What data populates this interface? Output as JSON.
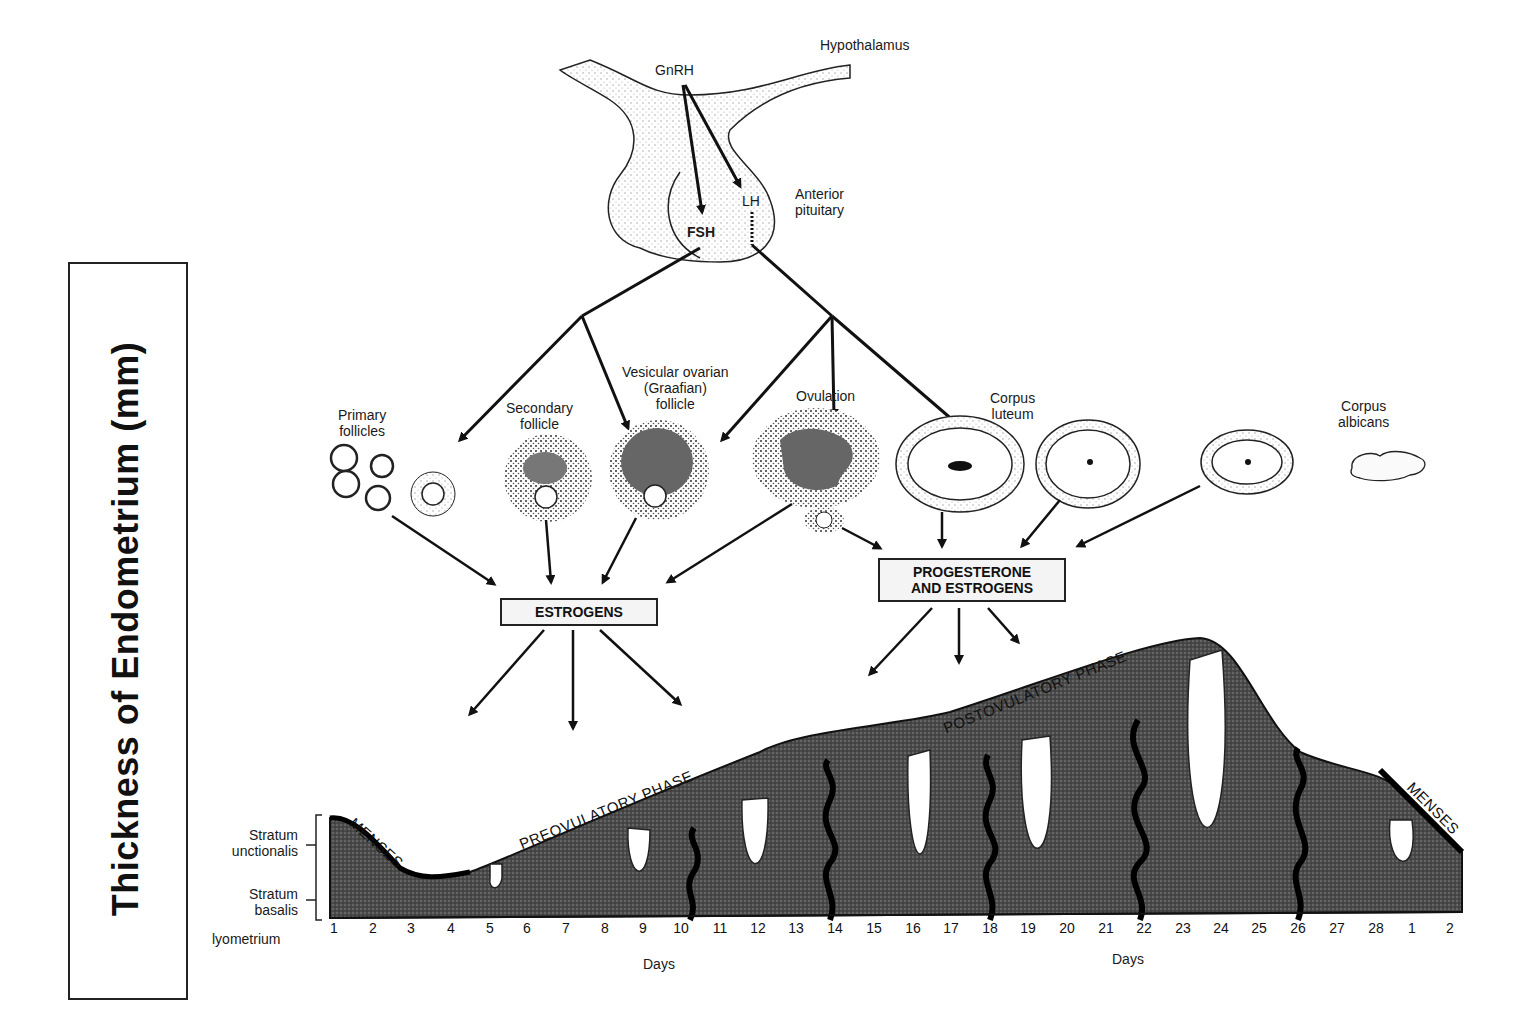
{
  "y_axis": {
    "label": "Thickness of  Endometrium (mm)"
  },
  "brain": {
    "hypothalamus": "Hypothalamus",
    "gnrh": "GnRH",
    "anterior_pituitary": "Anterior\npituitary",
    "lh": "LH",
    "fsh": "FSH"
  },
  "ovary_stages": {
    "primary_follicles": "Primary\nfollicles",
    "secondary_follicle": "Secondary\nfollicle",
    "graafian_follicle": "Vesicular ovarian\n(Graafian)\nfollicle",
    "ovulation": "Ovulation",
    "corpus_luteum": "Corpus\nluteum",
    "corpus_albicans": "Corpus\nalbicans"
  },
  "hormone_boxes": {
    "estrogens": "ESTROGENS",
    "progesterone_estrogens": "PROGESTERONE\nAND ESTROGENS"
  },
  "endometrium": {
    "phases": {
      "menses_start": "MENSES",
      "preovulatory": "PREOVULATORY PHASE",
      "postovulatory": "POSTOVULATORY PHASE",
      "menses_end": "MENSES"
    },
    "layers": {
      "stratum_functionalis": "Stratum\nunctionalis",
      "stratum_basalis": "Stratum\nbasalis",
      "myometrium": "lyometrium"
    },
    "x_axis_label": "Days",
    "days": [
      "1",
      "2",
      "3",
      "4",
      "5",
      "6",
      "7",
      "8",
      "9",
      "10",
      "11",
      "12",
      "13",
      "14",
      "15",
      "16",
      "17",
      "18",
      "19",
      "20",
      "21",
      "22",
      "23",
      "24",
      "25",
      "26",
      "27",
      "28",
      "1",
      "2"
    ]
  },
  "colors": {
    "ink": "#111111",
    "tissue": "#3a3a3a",
    "stipple": "#bdbdbd",
    "box_fill": "#f4f4f4"
  }
}
